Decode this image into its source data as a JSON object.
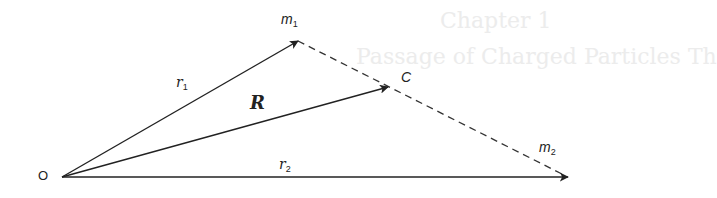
{
  "figure": {
    "background_bleed": {
      "line1": "Chapter 1",
      "line2": "Passage of Charged Particles Th"
    },
    "points": {
      "origin": {
        "label": "O",
        "x": 62,
        "y": 177
      },
      "m1": {
        "label": "m",
        "sub": "1",
        "x": 298,
        "y": 41
      },
      "c": {
        "label": "C",
        "x": 388,
        "y": 87
      },
      "m2": {
        "label": "m",
        "sub": "2",
        "x": 567,
        "y": 176
      }
    },
    "vectors": {
      "r1": {
        "label": "r",
        "sub": "1",
        "from": "origin",
        "to": "m1"
      },
      "R": {
        "label": "R",
        "from": "origin",
        "to": "c"
      },
      "r2": {
        "label": "r",
        "sub": "2",
        "from": "origin",
        "to": "m2"
      }
    },
    "dashed_line": {
      "from": "m1",
      "to": "m2",
      "through": "c"
    },
    "colors": {
      "ink": "#222222",
      "bleed": "#ececec",
      "background": "#ffffff"
    }
  }
}
